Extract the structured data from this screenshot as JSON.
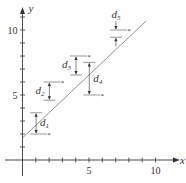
{
  "diagram": {
    "axes": {
      "x_label": "x",
      "y_label": "y",
      "x_ticks": [
        1,
        2,
        3,
        4,
        5,
        6,
        7,
        8,
        9,
        10
      ],
      "y_ticks": [
        1,
        2,
        3,
        4,
        5,
        6,
        7,
        8,
        9,
        10,
        11
      ],
      "x_tick_labels": [
        {
          "value": 5,
          "label": "5"
        },
        {
          "value": 10,
          "label": "10"
        }
      ],
      "y_tick_labels": [
        {
          "value": 5,
          "label": "5"
        },
        {
          "value": 10,
          "label": "10"
        }
      ]
    },
    "line": {
      "x1": 0,
      "y1": 1.7,
      "x2": 9.3,
      "y2": 10.7
    },
    "points": [
      {
        "x": 2,
        "y": 2,
        "label": "d",
        "sub": "1",
        "deviation_side": "right"
      },
      {
        "x": 3,
        "y": 6,
        "label": "d",
        "sub": "2",
        "deviation_side": "left"
      },
      {
        "x": 5,
        "y": 8,
        "label": "d",
        "sub": "3",
        "deviation_side": "left"
      },
      {
        "x": 6,
        "y": 5,
        "label": "d",
        "sub": "4",
        "deviation_side": "right"
      },
      {
        "x": 8,
        "y": 10,
        "label": "d",
        "sub": "5",
        "deviation_side": "top"
      }
    ],
    "colors": {
      "stroke": "#333333",
      "line": "#777777",
      "background": "#ffffff"
    }
  }
}
